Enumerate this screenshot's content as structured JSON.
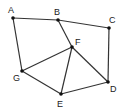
{
  "diagram": {
    "type": "graph",
    "nodes": [
      {
        "id": "A",
        "label": "A",
        "x": 13,
        "y": 18,
        "lx": 8,
        "ly": 13
      },
      {
        "id": "B",
        "label": "B",
        "x": 58,
        "y": 20,
        "lx": 54,
        "ly": 15
      },
      {
        "id": "C",
        "label": "C",
        "x": 109,
        "y": 28,
        "lx": 109,
        "ly": 23
      },
      {
        "id": "F",
        "label": "F",
        "x": 72,
        "y": 47,
        "lx": 75,
        "ly": 45
      },
      {
        "id": "G",
        "label": "G",
        "x": 22,
        "y": 71,
        "lx": 13,
        "ly": 81
      },
      {
        "id": "E",
        "label": "E",
        "x": 61,
        "y": 94,
        "lx": 57,
        "ly": 107
      },
      {
        "id": "D",
        "label": "D",
        "x": 108,
        "y": 82,
        "lx": 110,
        "ly": 92
      }
    ],
    "edges": [
      {
        "from": "A",
        "to": "B"
      },
      {
        "from": "B",
        "to": "C"
      },
      {
        "from": "A",
        "to": "G"
      },
      {
        "from": "B",
        "to": "F"
      },
      {
        "from": "C",
        "to": "D"
      },
      {
        "from": "F",
        "to": "G"
      },
      {
        "from": "F",
        "to": "E"
      },
      {
        "from": "F",
        "to": "D"
      },
      {
        "from": "G",
        "to": "E"
      },
      {
        "from": "E",
        "to": "D"
      }
    ]
  }
}
